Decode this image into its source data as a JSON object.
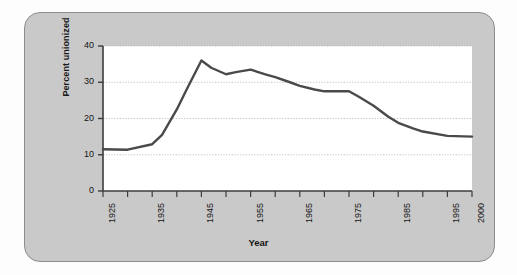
{
  "figure": {
    "panel_color": "#c9c9c9",
    "panel_border_color": "#8d8d8d",
    "plot_background": "#ffffff",
    "line_color": "#4a4a4a",
    "gridline_color": "#b0b0b0",
    "axis_color": "#3c3c3c"
  },
  "chart_data": {
    "type": "line",
    "title": "",
    "xlabel": "Year",
    "ylabel": "Percent unionized",
    "xlim": [
      1925,
      2000
    ],
    "ylim": [
      0,
      40
    ],
    "grid": true,
    "legend": "none",
    "y_ticks": [
      0,
      10,
      20,
      30,
      40
    ],
    "y_tick_labels": [
      "0",
      "10",
      "20",
      "30",
      "40"
    ],
    "y_gridlines": [
      10,
      20,
      30,
      40
    ],
    "x_ticks": [
      1925,
      1930,
      1935,
      1940,
      1945,
      1950,
      1955,
      1960,
      1965,
      1970,
      1975,
      1980,
      1985,
      1990,
      1995,
      2000
    ],
    "x_tick_labels": [
      {
        "year": 1925,
        "label": "1925"
      },
      {
        "year": 1930,
        "label": ""
      },
      {
        "year": 1935,
        "label": "1935"
      },
      {
        "year": 1940,
        "label": ""
      },
      {
        "year": 1945,
        "label": "1945"
      },
      {
        "year": 1950,
        "label": ""
      },
      {
        "year": 1955,
        "label": "1955"
      },
      {
        "year": 1960,
        "label": ""
      },
      {
        "year": 1965,
        "label": "1965"
      },
      {
        "year": 1970,
        "label": ""
      },
      {
        "year": 1975,
        "label": "1975"
      },
      {
        "year": 1980,
        "label": ""
      },
      {
        "year": 1985,
        "label": "1985"
      },
      {
        "year": 1990,
        "label": ""
      },
      {
        "year": 1995,
        "label": "1995"
      },
      {
        "year": 2000,
        "label": "2000"
      }
    ],
    "x": [
      1925,
      1930,
      1935,
      1937,
      1940,
      1942,
      1945,
      1947,
      1950,
      1952,
      1955,
      1958,
      1960,
      1963,
      1965,
      1968,
      1970,
      1975,
      1977,
      1980,
      1983,
      1985,
      1988,
      1990,
      1995,
      2000
    ],
    "series": [
      {
        "name": "Percent unionized",
        "values": [
          11.5,
          11.4,
          12.9,
          15.5,
          22.5,
          28.0,
          36.0,
          34.0,
          32.2,
          32.8,
          33.5,
          32.2,
          31.4,
          30.0,
          29.0,
          28.0,
          27.5,
          27.5,
          26.0,
          23.5,
          20.5,
          18.8,
          17.3,
          16.4,
          15.2,
          15.0
        ]
      }
    ]
  }
}
